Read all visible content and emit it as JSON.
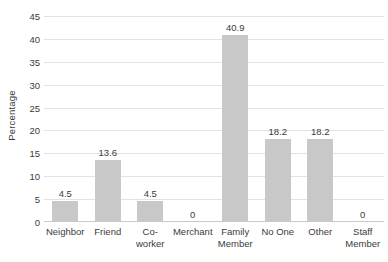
{
  "chart_data": {
    "type": "bar",
    "title": "",
    "xlabel": "",
    "ylabel": "Percentage",
    "ylim": [
      0,
      45
    ],
    "ytick_step": 5,
    "yticks": [
      45,
      40,
      35,
      30,
      25,
      20,
      15,
      10,
      5,
      0
    ],
    "grid": true,
    "legend": "none",
    "bar_color": "#c8c8c8",
    "categories": [
      "Neighbor",
      "Friend",
      "Co-worker",
      "Merchant",
      "Family Member",
      "No One",
      "Other",
      "Staff Member"
    ],
    "values": [
      4.5,
      13.6,
      4.5,
      0,
      40.9,
      18.2,
      18.2,
      0
    ],
    "data_labels": [
      "4.5",
      "13.6",
      "4.5",
      "0",
      "40.9",
      "18.2",
      "18.2",
      "0"
    ],
    "category_lines": [
      [
        "Neighbor"
      ],
      [
        "Friend"
      ],
      [
        "Co-worker"
      ],
      [
        "Merchant"
      ],
      [
        "Family",
        "Member"
      ],
      [
        "No One"
      ],
      [
        "Other"
      ],
      [
        "Staff",
        "Member"
      ]
    ]
  }
}
